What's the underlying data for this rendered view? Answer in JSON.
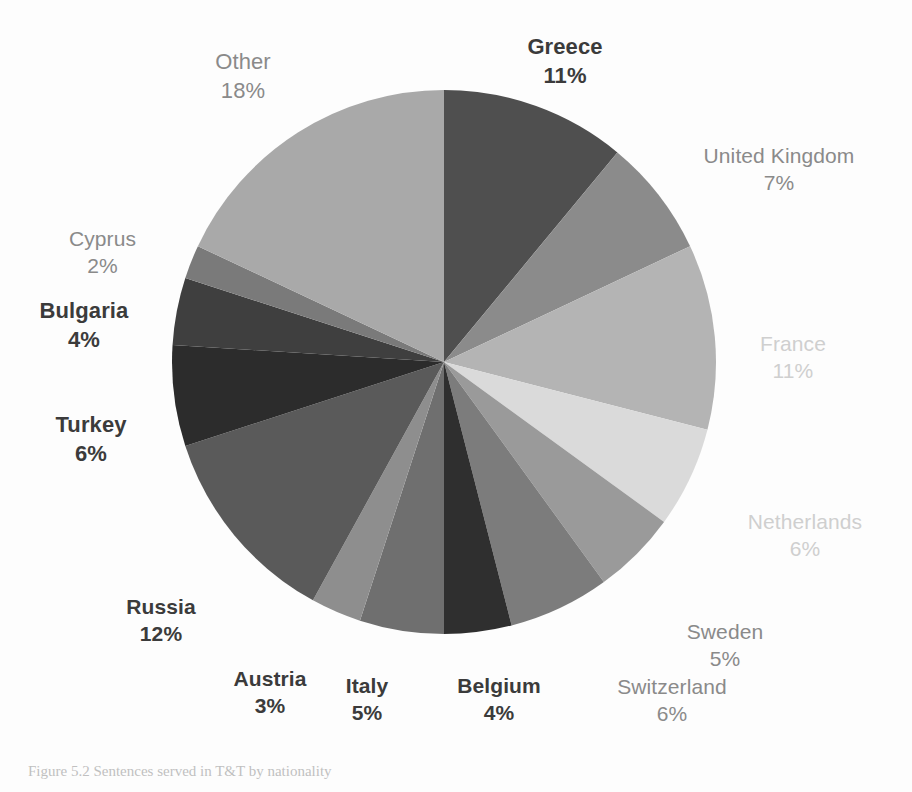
{
  "figure": {
    "background_color": "#fdfdfd",
    "caption": "Figure 5.2 Sentences served in T&T by nationality"
  },
  "chart_data": {
    "type": "pie",
    "title": "",
    "xlabel": "",
    "ylabel": "",
    "legend_position": "none",
    "grid": false,
    "start_angle_deg": 0,
    "direction": "clockwise",
    "total_percent": 100,
    "categories": [
      "Greece",
      "United Kingdom",
      "France",
      "Netherlands",
      "Sweden",
      "Switzerland",
      "Belgium",
      "Italy",
      "Austria",
      "Russia",
      "Turkey",
      "Bulgaria",
      "Cyprus",
      "Other"
    ],
    "values": [
      11,
      7,
      11,
      6,
      5,
      6,
      4,
      5,
      3,
      12,
      6,
      4,
      2,
      18
    ],
    "value_labels": [
      "11%",
      "7%",
      "11%",
      "6%",
      "5%",
      "6%",
      "4%",
      "5%",
      "3%",
      "12%",
      "6%",
      "4%",
      "2%",
      "18%"
    ],
    "colors": [
      "#4f4f4f",
      "#8b8b8b",
      "#b4b4b4",
      "#dadada",
      "#9a9a9a",
      "#7c7c7c",
      "#2f2f2f",
      "#6f6f6f",
      "#8e8e8e",
      "#5a5a5a",
      "#2c2c2c",
      "#3f3f3f",
      "#7a7a7a",
      "#a9a9a9"
    ]
  },
  "labels": [
    {
      "name": "Greece",
      "pct": "11%"
    },
    {
      "name": "United Kingdom",
      "pct": "7%"
    },
    {
      "name": "France",
      "pct": "11%"
    },
    {
      "name": "Netherlands",
      "pct": "6%"
    },
    {
      "name": "Sweden",
      "pct": "5%"
    },
    {
      "name": "Switzerland",
      "pct": "6%"
    },
    {
      "name": "Belgium",
      "pct": "4%"
    },
    {
      "name": "Italy",
      "pct": "5%"
    },
    {
      "name": "Austria",
      "pct": "3%"
    },
    {
      "name": "Russia",
      "pct": "12%"
    },
    {
      "name": "Turkey",
      "pct": "6%"
    },
    {
      "name": "Bulgaria",
      "pct": "4%"
    },
    {
      "name": "Cyprus",
      "pct": "2%"
    },
    {
      "name": "Other",
      "pct": "18%"
    }
  ]
}
